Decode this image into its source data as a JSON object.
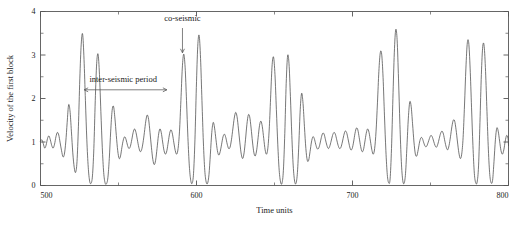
{
  "chart_data": {
    "type": "line",
    "title": "",
    "xlabel": "Time units",
    "ylabel": "Velocity of the first block",
    "xlim": [
      500,
      800
    ],
    "ylim": [
      0,
      4
    ],
    "xticks": [
      500,
      600,
      700,
      800
    ],
    "xtick_labels": [
      "500",
      "600",
      "700",
      "800"
    ],
    "xminor_ticks": [
      550,
      650,
      750
    ],
    "yticks": [
      0,
      1,
      2,
      3,
      4
    ],
    "ytick_labels": [
      "0",
      "1",
      "2",
      "3",
      "4"
    ],
    "yminor_ticks": [
      0.5,
      1.5,
      2.5,
      3.5
    ],
    "grid": false,
    "legend": null,
    "line_color": "#4a4a4a",
    "annotations": [
      {
        "id": "co-seismic",
        "label": "co-seismic",
        "label_x": 591,
        "label_y": 3.78,
        "arrow": "down",
        "arrow_x": 591,
        "arrow_y_from": 3.62,
        "arrow_y_to": 3.05
      },
      {
        "id": "inter-seismic-period",
        "label": "inter-seismic period",
        "label_x": 553,
        "label_y": 2.38,
        "arrow": "double-horizontal",
        "arrow_y": 2.2,
        "arrow_x_from": 528,
        "arrow_x_to": 581
      }
    ],
    "series": [
      {
        "name": "Velocity of the first block",
        "x": [
          500.0,
          500.9,
          501.8,
          502.7,
          503.6,
          504.5,
          505.4,
          506.3,
          507.2,
          508.1,
          509.0,
          509.9,
          510.8,
          511.7,
          512.6,
          513.5,
          514.4,
          515.3,
          516.2,
          517.1,
          518.0,
          518.9,
          519.8,
          520.7,
          521.6,
          522.5,
          523.4,
          524.3,
          525.2,
          526.1,
          527.0,
          527.9,
          528.8,
          529.7,
          530.6,
          531.5,
          532.4,
          533.3,
          534.2,
          535.1,
          536.0,
          536.9,
          537.8,
          538.7,
          539.6,
          540.5,
          541.4,
          542.3,
          543.2,
          544.1,
          545.0,
          545.9,
          546.8,
          547.7,
          548.6,
          549.5,
          550.4,
          551.3,
          552.2,
          553.1,
          554.0,
          554.9,
          555.8,
          556.7,
          557.6,
          558.5,
          559.4,
          560.3,
          561.2,
          562.1,
          563.0,
          563.9,
          564.8,
          565.7,
          566.6,
          567.5,
          568.4,
          569.3,
          570.2,
          571.1,
          572.0,
          572.9,
          573.8,
          574.7,
          575.6,
          576.5,
          577.4,
          578.3,
          579.2,
          580.1,
          581.0,
          581.9,
          582.8,
          583.7,
          584.6,
          585.5,
          586.4,
          587.3,
          588.2,
          589.1,
          590.0,
          590.9,
          591.8,
          592.7,
          593.6,
          594.5,
          595.4,
          596.3,
          597.2,
          598.1,
          599.0,
          599.9,
          600.8,
          601.7,
          602.6,
          603.5,
          604.4,
          605.3,
          606.2,
          607.1,
          608.0,
          608.9,
          609.8,
          610.7,
          611.6,
          612.5,
          613.4,
          614.3,
          615.2,
          616.1,
          617.0,
          617.9,
          618.8,
          619.7,
          620.6,
          621.5,
          622.4,
          623.3,
          624.2,
          625.1,
          626.0,
          626.9,
          627.8,
          628.7,
          629.6,
          630.5,
          631.4,
          632.3,
          633.2,
          634.1,
          635.0,
          635.9,
          636.8,
          637.7,
          638.6,
          639.5,
          640.4,
          641.3,
          642.2,
          643.1,
          644.0,
          644.9,
          645.8,
          646.7,
          647.6,
          648.5,
          649.4,
          650.3,
          651.2,
          652.1,
          653.0,
          653.9,
          654.8,
          655.7,
          656.6,
          657.5,
          658.4,
          659.3,
          660.2,
          661.1,
          662.0,
          662.9,
          663.8,
          664.7,
          665.6,
          666.5,
          667.4,
          668.3,
          669.2,
          670.1,
          671.0,
          671.9,
          672.8,
          673.7,
          674.6,
          675.5,
          676.4,
          677.3,
          678.2,
          679.1,
          680.0,
          680.9,
          681.8,
          682.7,
          683.6,
          684.5,
          685.4,
          686.3,
          687.2,
          688.1,
          689.0,
          689.9,
          690.8,
          691.7,
          692.6,
          693.5,
          694.4,
          695.3,
          696.2,
          697.1,
          698.0,
          698.9,
          699.8,
          700.7,
          701.6,
          702.5,
          703.4,
          704.3,
          705.2,
          706.1,
          707.0,
          707.9,
          708.8,
          709.7,
          710.6,
          711.5,
          712.4,
          713.3,
          714.2,
          715.1,
          716.0,
          716.9,
          717.8,
          718.7,
          719.6,
          720.5,
          721.4,
          722.3,
          723.2,
          724.1,
          725.0,
          725.9,
          726.8,
          727.7,
          728.6,
          729.5,
          730.4,
          731.3,
          732.2,
          733.1,
          734.0,
          734.9,
          735.8,
          736.7,
          737.6,
          738.5,
          739.4,
          740.3,
          741.2,
          742.1,
          743.0,
          743.9,
          744.8,
          745.7,
          746.6,
          747.5,
          748.4,
          749.3,
          750.2,
          751.1,
          752.0,
          752.9,
          753.8,
          754.7,
          755.6,
          756.5,
          757.4,
          758.3,
          759.2,
          760.1,
          761.0,
          761.9,
          762.8,
          763.7,
          764.6,
          765.5,
          766.4,
          767.3,
          768.2,
          769.1,
          770.0,
          770.9,
          771.8,
          772.7,
          773.6,
          774.5,
          775.4,
          776.3,
          777.2,
          778.1,
          779.0,
          779.9,
          780.8,
          781.7,
          782.6,
          783.5,
          784.4,
          785.3,
          786.2,
          787.1,
          788.0,
          788.9,
          789.8,
          790.7,
          791.6,
          792.5,
          793.4,
          794.3,
          795.2,
          796.1,
          797.0,
          797.9,
          798.8,
          799.7,
          800.0
        ],
        "y": [
          1.02,
          1.05,
          0.96,
          0.86,
          0.93,
          1.08,
          1.14,
          1.05,
          0.92,
          0.86,
          0.95,
          1.12,
          1.22,
          1.16,
          0.98,
          0.8,
          0.66,
          0.72,
          1.0,
          1.45,
          1.85,
          1.72,
          1.25,
          0.75,
          0.42,
          0.3,
          0.55,
          1.35,
          2.45,
          3.25,
          3.48,
          2.9,
          1.95,
          1.05,
          0.42,
          0.1,
          0.05,
          0.22,
          0.85,
          1.95,
          2.8,
          3.02,
          2.55,
          1.7,
          0.88,
          0.3,
          0.06,
          0.04,
          0.18,
          0.62,
          1.25,
          1.72,
          1.82,
          1.55,
          1.15,
          0.8,
          0.62,
          0.68,
          0.88,
          1.05,
          1.12,
          1.05,
          0.92,
          0.85,
          0.9,
          1.05,
          1.22,
          1.3,
          1.22,
          1.05,
          0.88,
          0.78,
          0.82,
          0.98,
          1.22,
          1.48,
          1.62,
          1.52,
          1.22,
          0.88,
          0.6,
          0.48,
          0.58,
          0.85,
          1.15,
          1.3,
          1.22,
          1.0,
          0.8,
          0.72,
          0.8,
          1.0,
          1.2,
          1.28,
          1.18,
          0.98,
          0.8,
          0.72,
          0.85,
          1.25,
          1.95,
          2.7,
          3.02,
          2.72,
          1.95,
          1.1,
          0.45,
          0.12,
          0.05,
          0.28,
          1.05,
          2.25,
          3.2,
          3.45,
          2.92,
          1.95,
          1.0,
          0.35,
          0.08,
          0.05,
          0.25,
          0.72,
          1.22,
          1.45,
          1.32,
          1.05,
          0.8,
          0.7,
          0.78,
          0.95,
          1.12,
          1.18,
          1.1,
          0.95,
          0.85,
          0.88,
          1.05,
          1.3,
          1.55,
          1.68,
          1.58,
          1.3,
          0.98,
          0.72,
          0.62,
          0.75,
          1.05,
          1.4,
          1.62,
          1.58,
          1.32,
          1.0,
          0.75,
          0.68,
          0.82,
          1.1,
          1.38,
          1.48,
          1.35,
          1.08,
          0.82,
          0.72,
          0.88,
          1.35,
          2.1,
          2.78,
          2.95,
          2.55,
          1.75,
          0.95,
          0.35,
          0.08,
          0.05,
          0.35,
          1.2,
          2.35,
          2.98,
          2.8,
          2.05,
          1.15,
          0.45,
          0.1,
          0.05,
          0.3,
          0.95,
          1.75,
          2.12,
          1.88,
          1.35,
          0.85,
          0.58,
          0.58,
          0.78,
          1.0,
          1.12,
          1.08,
          0.95,
          0.85,
          0.85,
          0.95,
          1.1,
          1.2,
          1.18,
          1.05,
          0.92,
          0.85,
          0.9,
          1.02,
          1.15,
          1.22,
          1.18,
          1.05,
          0.92,
          0.85,
          0.88,
          1.0,
          1.15,
          1.25,
          1.22,
          1.08,
          0.92,
          0.82,
          0.85,
          1.0,
          1.2,
          1.32,
          1.28,
          1.1,
          0.9,
          0.78,
          0.82,
          1.0,
          1.2,
          1.3,
          1.22,
          1.02,
          0.82,
          0.72,
          0.85,
          1.25,
          1.9,
          2.62,
          3.05,
          3.02,
          2.48,
          1.6,
          0.8,
          0.25,
          0.06,
          0.15,
          0.85,
          2.0,
          3.05,
          3.58,
          3.35,
          2.45,
          1.4,
          0.55,
          0.12,
          0.05,
          0.28,
          0.9,
          1.55,
          1.92,
          1.82,
          1.42,
          1.0,
          0.72,
          0.68,
          0.82,
          1.0,
          1.1,
          1.08,
          0.98,
          0.9,
          0.9,
          0.98,
          1.08,
          1.15,
          1.12,
          1.02,
          0.92,
          0.88,
          0.95,
          1.08,
          1.2,
          1.25,
          1.18,
          1.02,
          0.88,
          0.82,
          0.92,
          1.12,
          1.35,
          1.5,
          1.48,
          1.28,
          1.0,
          0.75,
          0.62,
          0.72,
          1.1,
          1.85,
          2.7,
          3.28,
          3.28,
          2.7,
          1.8,
          0.92,
          0.28,
          0.06,
          0.08,
          0.45,
          1.45,
          2.55,
          3.2,
          3.2,
          2.62,
          1.7,
          0.82,
          0.25,
          0.06,
          0.12,
          0.55,
          1.05,
          1.32,
          1.25,
          1.02,
          0.8,
          0.72,
          0.82,
          1.02,
          1.15,
          1.08,
          0.92
        ]
      }
    ]
  }
}
